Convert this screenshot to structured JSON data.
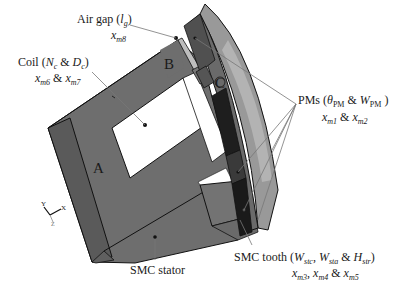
{
  "figure": {
    "colors": {
      "stator": "#6e6e6e",
      "stator_dark": "#555555",
      "coil_window": "#ffffff",
      "rotor_outer": "#8a8a8a",
      "pm_dark": "#1e1e1e",
      "pm_mid": "#3a3a3a",
      "leader_line": "#777777",
      "outline": "#111111"
    },
    "regions": {
      "a": "A",
      "b": "B",
      "c": "C"
    },
    "labels": {
      "air_gap": {
        "name": "Air gap (",
        "symbol": "l",
        "symbol_sub": "g",
        "close": ")",
        "var": "x",
        "var_sub": "m8"
      },
      "coil": {
        "name": "Coil (",
        "sym1": "N",
        "sym1_sub": "c",
        "amp": " & ",
        "sym2": "D",
        "sym2_sub": "c",
        "close": ")",
        "var1": "x",
        "var1_sub": "m6",
        "amp2": " & ",
        "var2": "x",
        "var2_sub": "m7"
      },
      "pms": {
        "name": "PMs (",
        "sym1": "θ",
        "sym1_sub": "PM",
        "amp": " & ",
        "sym2": "W",
        "sym2_sub": "PM",
        "close": " )",
        "var1": "x",
        "var1_sub": "m1",
        "amp2": " & ",
        "var2": "x",
        "var2_sub": "m2"
      },
      "smc_tooth": {
        "name": "SMC tooth (",
        "sym1": "W",
        "sym1_sub": "stc",
        "sep": ", ",
        "sym2": "W",
        "sym2_sub": "sta",
        "amp": " & ",
        "sym3": "H",
        "sym3_sub": "str",
        "close": ")",
        "var1": "x",
        "var1_sub": "m3",
        "sep2": ", ",
        "var2": "x",
        "var2_sub": "m4",
        "amp2": " & ",
        "var3": "x",
        "var3_sub": "m5"
      },
      "smc_stator": {
        "name": "SMC stator"
      }
    },
    "axes_triad": {
      "y": "Y",
      "x": "X",
      "z": "Z"
    }
  }
}
